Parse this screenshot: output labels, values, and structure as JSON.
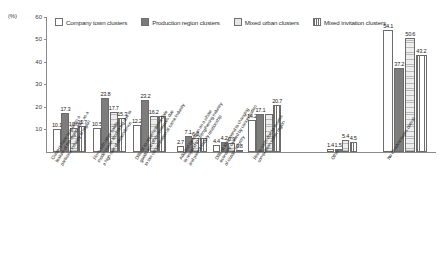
{
  "chart_data": {
    "type": "bar",
    "title": "",
    "xlabel": "",
    "ylabel": "(%)",
    "ylim": [
      0,
      60
    ],
    "yticks": [
      0,
      10,
      20,
      30,
      40,
      50,
      60
    ],
    "ytick_labels": [
      "",
      "10",
      "20",
      "30",
      "40",
      "50",
      "60"
    ],
    "grid": false,
    "legend_position": "top",
    "categories": [
      "Clusters have long been a feature of the region such as a particular industry",
      "Firms with other habits inside cluster tend to big due to a high rate of dependence",
      "Difficult to obtain intermediate goods and other resources due to low concentration of same industry",
      "Adopted by region as a whole to respond to strengthening industry and parent-supply relationship",
      "Difficult to respond to changing economy caused by concentration of cluster industry",
      "Rising costs due to excess competition within region",
      "Other",
      "No disadvantages overall"
    ],
    "series": [
      {
        "name": "Company town clusters",
        "color": "#fdfdfd",
        "values": [
          10.1,
          10.5,
          12.2,
          2.7,
          3.1,
          14.2,
          1.4,
          54.1
        ]
      },
      {
        "name": "Production region clusters",
        "color": "#7d7d7d",
        "values": [
          17.3,
          23.8,
          23.2,
          7.1,
          4.4,
          17.1,
          1.5,
          37.2
        ]
      },
      {
        "name": "Mixed urban clusters",
        "color": "#ededed",
        "values": [
          10.6,
          17.7,
          16.2,
          6.3,
          4.2,
          17.0,
          5.4,
          50.6
        ]
      },
      {
        "name": "Mixed invitation clusters",
        "color": "#ffffff",
        "values": [
          11.7,
          15.3,
          16.2,
          6.3,
          0.9,
          20.7,
          4.5,
          43.2
        ]
      }
    ],
    "value_labels": {
      "group_0": [
        "10.1",
        "17.3",
        "10.6",
        "11.7"
      ],
      "group_1": [
        "10.5",
        "23.8",
        "17.7",
        "15.3"
      ],
      "group_2": [
        "12.2",
        "23.2",
        "16.2",
        ""
      ],
      "group_3": [
        "2.7",
        "7.1",
        "6.3",
        ""
      ],
      "group_4": [
        "4.4",
        "4.2",
        "0.9",
        "0.8"
      ],
      "group_5": [
        "14.2",
        "17.1",
        "",
        "20.7"
      ],
      "group_6": [
        "1.4",
        "1.5",
        "5.4",
        "4.5"
      ],
      "group_7": [
        "54.1",
        "37.2",
        "50.6",
        "43.2"
      ]
    }
  },
  "legend": {
    "items": [
      {
        "label": "Company town clusters",
        "swatch": "company-swatch"
      },
      {
        "label": "Production region clusters",
        "swatch": "production-swatch"
      },
      {
        "label": "Mixed urban clusters",
        "swatch": "urban-swatch"
      },
      {
        "label": "Mixed invitation clusters",
        "swatch": "invitation-swatch"
      }
    ]
  },
  "axis": {
    "unit_label": "(%)",
    "tick_60": "60",
    "tick_50": "50",
    "tick_40": "40",
    "tick_30": "30",
    "tick_20": "20",
    "tick_10": "10"
  },
  "category_labels": {
    "c0_l1": "Clusters have long been a",
    "c0_l2": "feature of the region such as a",
    "c0_l3": "particular industry of region",
    "c1_l1": "Firms with other habits",
    "c1_l2": "inside cluster tend to big due to",
    "c1_l3": "a high rate of dependence",
    "c2_l1": "Difficult to obtain intermediate",
    "c2_l2": "goods and other resources due",
    "c2_l3": "to low concentration of same industry",
    "c3_l1": "Adopted by region as a whole",
    "c3_l2": "to respond to strengthening industry",
    "c3_l3": "and parent-supply relationship",
    "c4_l1": "Difficult to respond to changing",
    "c4_l2": "economy caused by concentration",
    "c4_l3": "of cluster industry",
    "c5_l1": "Rising costs due to excess",
    "c5_l2": "competition within region",
    "c6_l1": "Other",
    "c7_l1": "No disadvantages overall"
  }
}
